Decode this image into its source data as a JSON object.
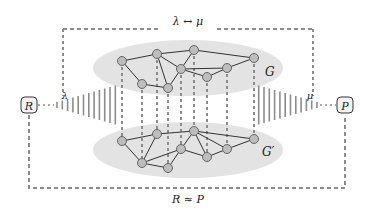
{
  "labels": {
    "top": "λ ↔ μ",
    "bottom": "R ≈ P",
    "lambda": "λ",
    "mu": "μ",
    "graph_top": "G",
    "graph_bottom": "G′",
    "left_node": "R",
    "right_node": "P"
  },
  "colors": {
    "ellipse_fill": "#e3e3e3",
    "node_fill": "#bdbdbd",
    "node_stroke": "#666666",
    "edge": "#333333",
    "dash": "#8c8c8c"
  },
  "graph_top": {
    "nodes": [
      [
        122,
        61
      ],
      [
        157,
        54
      ],
      [
        194,
        50
      ],
      [
        254,
        58
      ],
      [
        181,
        69
      ],
      [
        227,
        68
      ],
      [
        207,
        77
      ],
      [
        142,
        84
      ],
      [
        168,
        88
      ]
    ],
    "edges": [
      [
        0,
        1
      ],
      [
        1,
        2
      ],
      [
        2,
        3
      ],
      [
        1,
        4
      ],
      [
        2,
        4
      ],
      [
        4,
        5
      ],
      [
        5,
        3
      ],
      [
        4,
        6
      ],
      [
        6,
        5
      ],
      [
        0,
        7
      ],
      [
        7,
        8
      ],
      [
        8,
        4
      ],
      [
        1,
        8
      ]
    ]
  },
  "graph_bottom": {
    "nodes": [
      [
        122,
        141
      ],
      [
        157,
        134
      ],
      [
        194,
        131
      ],
      [
        254,
        139
      ],
      [
        181,
        149
      ],
      [
        227,
        149
      ],
      [
        207,
        157
      ],
      [
        142,
        163
      ],
      [
        168,
        168
      ]
    ],
    "edges": [
      [
        0,
        1
      ],
      [
        1,
        2
      ],
      [
        2,
        3
      ],
      [
        2,
        4
      ],
      [
        2,
        5
      ],
      [
        2,
        6
      ],
      [
        5,
        3
      ],
      [
        4,
        7
      ],
      [
        7,
        8
      ],
      [
        8,
        4
      ],
      [
        1,
        7
      ],
      [
        0,
        7
      ],
      [
        6,
        5
      ],
      [
        4,
        6
      ]
    ]
  }
}
